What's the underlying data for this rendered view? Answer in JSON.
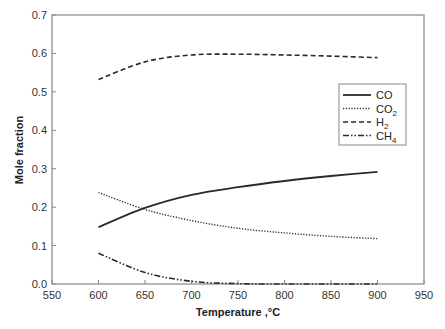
{
  "chart_data": {
    "type": "line",
    "title": "",
    "xlabel": "Temperature ,°C",
    "ylabel": "Mole fraction",
    "xlim": [
      550,
      950
    ],
    "ylim": [
      0.0,
      0.7
    ],
    "x_ticks": [
      "550",
      "600",
      "650",
      "700",
      "750",
      "800",
      "850",
      "900",
      "950"
    ],
    "y_ticks": [
      "0.0",
      "0.1",
      "0.2",
      "0.3",
      "0.4",
      "0.5",
      "0.6",
      "0.7"
    ],
    "grid": false,
    "legend_position": "right-center inside",
    "x": [
      600,
      650,
      700,
      750,
      800,
      850,
      900
    ],
    "series": [
      {
        "name": "CO",
        "label_main": "CO",
        "label_sub": "",
        "style": "solid",
        "values": [
          0.148,
          0.198,
          0.232,
          0.252,
          0.268,
          0.281,
          0.292
        ]
      },
      {
        "name": "CO2",
        "label_main": "CO",
        "label_sub": "2",
        "style": "dotted",
        "values": [
          0.238,
          0.194,
          0.165,
          0.145,
          0.133,
          0.124,
          0.118
        ]
      },
      {
        "name": "H2",
        "label_main": "H",
        "label_sub": "2",
        "style": "dashed",
        "values": [
          0.532,
          0.578,
          0.596,
          0.598,
          0.596,
          0.593,
          0.589
        ]
      },
      {
        "name": "CH4",
        "label_main": "CH",
        "label_sub": "4",
        "style": "dash-dot-dot",
        "values": [
          0.08,
          0.03,
          0.007,
          0.001,
          0.0,
          0.0,
          0.0
        ]
      }
    ]
  },
  "colors": {
    "frame": "#888888",
    "line": "#2a2a2a",
    "text": "#333333"
  }
}
